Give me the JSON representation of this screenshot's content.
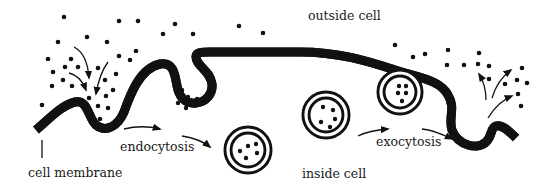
{
  "labels": {
    "outside": "outside cell",
    "inside": "inside cell",
    "membrane": "cell membrane",
    "endocytosis": "endocytosis",
    "exocytosis": "exocytosis"
  },
  "colors": {
    "ink": "#111111",
    "background": "#ffffff"
  },
  "diagram": {
    "regions": [
      "outside cell",
      "inside cell"
    ],
    "processes": [
      {
        "name": "endocytosis",
        "direction": "outside to inside",
        "stages": [
          "membrane invagination with particles",
          "budding vesicle",
          "free vesicle inside cell"
        ]
      },
      {
        "name": "exocytosis",
        "direction": "inside to outside",
        "stages": [
          "free vesicle inside cell",
          "vesicle fusing with membrane",
          "membrane opening releasing particles"
        ]
      }
    ]
  }
}
